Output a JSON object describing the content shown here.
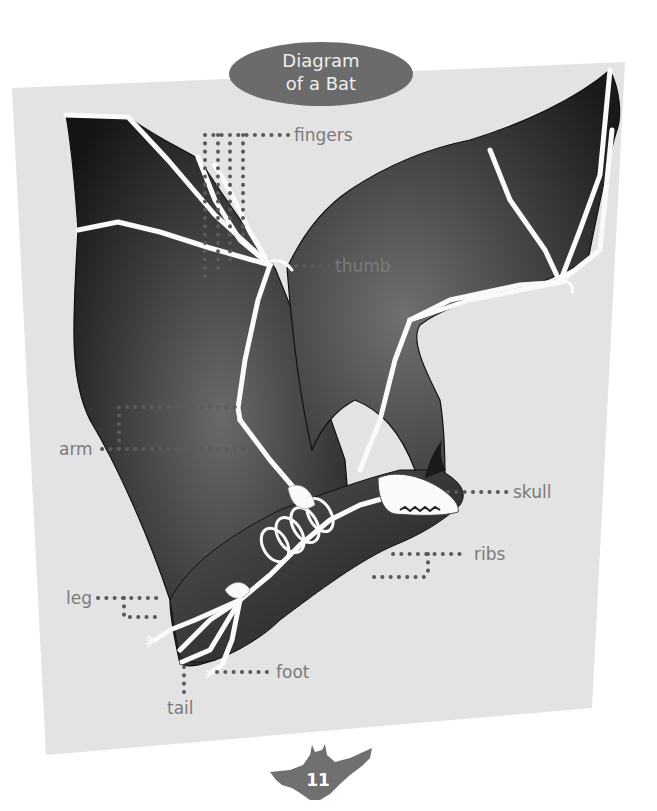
{
  "title": {
    "line1": "Diagram",
    "line2": "of a Bat"
  },
  "labels": {
    "fingers": "fingers",
    "thumb": "thumb",
    "arm": "arm",
    "skull": "skull",
    "ribs": "ribs",
    "leg": "leg",
    "foot": "foot",
    "tail": "tail"
  },
  "page": {
    "number": "11",
    "icon": "bat-icon"
  },
  "colors": {
    "panel": "#e3e3e3",
    "title_badge": "#6b6b6b",
    "wing_membrane": "#2a2a2a",
    "bone": "#fafafa",
    "label_text": "#7a7a7a",
    "leader_dots": "#5a5a5a",
    "page_bat": "#707070"
  }
}
